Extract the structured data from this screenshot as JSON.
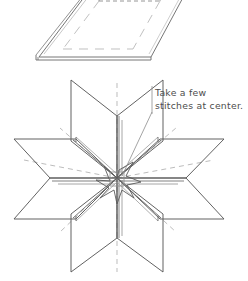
{
  "document": {
    "type": "craft-instruction-illustration",
    "background_color": "#ffffff",
    "line_color": "#555555",
    "text_color": "#4d4d4d"
  },
  "annotation": {
    "line1": "Take a few",
    "line2": "stitches at center.",
    "full_text": "Take a few stitches at center.",
    "leader_target": "star-center"
  },
  "figures": [
    {
      "name": "folded-sheet",
      "label": "flat folded sheet in perspective",
      "has_dashed_inner_outline": true,
      "edge_style": "double-line-thickness"
    },
    {
      "name": "folded-star",
      "label": "eight pointed folded paper star",
      "point_count": 8,
      "has_dashed_fold_lines": true,
      "center": {
        "x": 117,
        "y": 178
      }
    }
  ]
}
